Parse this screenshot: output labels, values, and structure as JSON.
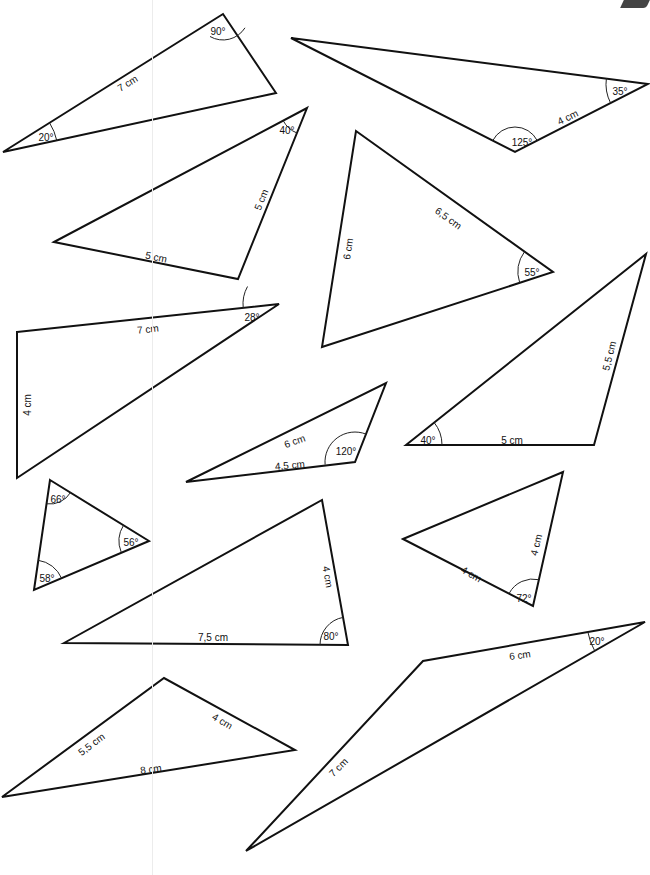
{
  "worksheet": {
    "triangles": [
      {
        "id": 1,
        "vertices": [
          [
            3,
            152
          ],
          [
            223,
            14
          ],
          [
            276,
            93
          ]
        ],
        "labels": [
          {
            "type": "angle",
            "text": "90°",
            "x": 218,
            "y": 32,
            "rot": 0
          },
          {
            "type": "angle",
            "text": "20°",
            "x": 46,
            "y": 138,
            "rot": 0
          },
          {
            "type": "side",
            "text": "7 cm",
            "x": 128,
            "y": 84,
            "rot": -32
          }
        ]
      },
      {
        "id": 2,
        "vertices": [
          [
            291,
            38
          ],
          [
            648,
            84
          ],
          [
            515,
            152
          ]
        ],
        "labels": [
          {
            "type": "angle",
            "text": "35°",
            "x": 620,
            "y": 92,
            "rot": 0
          },
          {
            "type": "angle",
            "text": "125°",
            "x": 522,
            "y": 143,
            "rot": 0
          },
          {
            "type": "side",
            "text": "4 cm",
            "x": 568,
            "y": 118,
            "rot": -26
          }
        ]
      },
      {
        "id": 3,
        "vertices": [
          [
            54,
            242
          ],
          [
            307,
            108
          ],
          [
            238,
            279
          ]
        ],
        "labels": [
          {
            "type": "angle",
            "text": "40°",
            "x": 287,
            "y": 131,
            "rot": 0
          },
          {
            "type": "side",
            "text": "5 cm",
            "x": 262,
            "y": 200,
            "rot": -68
          },
          {
            "type": "side",
            "text": "5 cm",
            "x": 156,
            "y": 258,
            "rot": 12
          }
        ]
      },
      {
        "id": 4,
        "vertices": [
          [
            356,
            131
          ],
          [
            553,
            272
          ],
          [
            322,
            347
          ]
        ],
        "labels": [
          {
            "type": "side",
            "text": "6,5 cm",
            "x": 448,
            "y": 219,
            "rot": 36
          },
          {
            "type": "side",
            "text": "6 cm",
            "x": 349,
            "y": 249,
            "rot": -82
          },
          {
            "type": "angle",
            "text": "55°",
            "x": 532,
            "y": 273,
            "rot": 0
          }
        ]
      },
      {
        "id": 5,
        "vertices": [
          [
            17,
            332
          ],
          [
            279,
            304
          ],
          [
            17,
            478
          ]
        ],
        "labels": [
          {
            "type": "side",
            "text": "7 cm",
            "x": 148,
            "y": 330,
            "rot": -6
          },
          {
            "type": "side",
            "text": "4 cm",
            "x": 28,
            "y": 405,
            "rot": -90
          },
          {
            "type": "angle",
            "text": "28°",
            "x": 252,
            "y": 318,
            "rot": 0
          }
        ]
      },
      {
        "id": 6,
        "vertices": [
          [
            406,
            445
          ],
          [
            646,
            254
          ],
          [
            594,
            445
          ]
        ],
        "labels": [
          {
            "type": "angle",
            "text": "40°",
            "x": 428,
            "y": 441,
            "rot": 0
          },
          {
            "type": "side",
            "text": "5 cm",
            "x": 512,
            "y": 441,
            "rot": 0
          },
          {
            "type": "side",
            "text": "5,5 cm",
            "x": 610,
            "y": 356,
            "rot": -76
          }
        ]
      },
      {
        "id": 7,
        "vertices": [
          [
            186,
            482
          ],
          [
            386,
            383
          ],
          [
            355,
            462
          ]
        ],
        "labels": [
          {
            "type": "side",
            "text": "6 cm",
            "x": 295,
            "y": 442,
            "rot": -20
          },
          {
            "type": "side",
            "text": "4,5 cm",
            "x": 290,
            "y": 466,
            "rot": -5
          },
          {
            "type": "angle",
            "text": "120°",
            "x": 346,
            "y": 452,
            "rot": 0
          }
        ]
      },
      {
        "id": 8,
        "vertices": [
          [
            50,
            480
          ],
          [
            149,
            541
          ],
          [
            34,
            590
          ]
        ],
        "labels": [
          {
            "type": "angle",
            "text": "66°",
            "x": 58,
            "y": 500,
            "rot": 0
          },
          {
            "type": "angle",
            "text": "56°",
            "x": 131,
            "y": 543,
            "rot": 0
          },
          {
            "type": "angle",
            "text": "58°",
            "x": 47,
            "y": 579,
            "rot": 0
          }
        ]
      },
      {
        "id": 9,
        "vertices": [
          [
            64,
            643
          ],
          [
            322,
            500
          ],
          [
            348,
            645
          ]
        ],
        "labels": [
          {
            "type": "side",
            "text": "7,5 cm",
            "x": 213,
            "y": 638,
            "rot": 0
          },
          {
            "type": "side",
            "text": "4 cm",
            "x": 327,
            "y": 577,
            "rot": 80
          },
          {
            "type": "angle",
            "text": "80°",
            "x": 331,
            "y": 637,
            "rot": 0
          }
        ]
      },
      {
        "id": 10,
        "vertices": [
          [
            403,
            539
          ],
          [
            563,
            472
          ],
          [
            533,
            606
          ]
        ],
        "labels": [
          {
            "type": "side",
            "text": "4 cm",
            "x": 471,
            "y": 575,
            "rot": 30
          },
          {
            "type": "side",
            "text": "4 cm",
            "x": 537,
            "y": 545,
            "rot": -76
          },
          {
            "type": "angle",
            "text": "72°",
            "x": 524,
            "y": 599,
            "rot": 0
          }
        ]
      },
      {
        "id": 11,
        "vertices": [
          [
            2,
            797
          ],
          [
            164,
            678
          ],
          [
            295,
            750
          ]
        ],
        "labels": [
          {
            "type": "side",
            "text": "5,5 cm",
            "x": 92,
            "y": 745,
            "rot": -37
          },
          {
            "type": "side",
            "text": "4 cm",
            "x": 222,
            "y": 722,
            "rot": 30
          },
          {
            "type": "side",
            "text": "8 cm",
            "x": 151,
            "y": 770,
            "rot": -8
          }
        ]
      },
      {
        "id": 12,
        "vertices": [
          [
            246,
            851
          ],
          [
            423,
            661
          ],
          [
            645,
            622
          ]
        ],
        "labels": [
          {
            "type": "side",
            "text": "7 cm",
            "x": 339,
            "y": 768,
            "rot": -45
          },
          {
            "type": "side",
            "text": "6 cm",
            "x": 520,
            "y": 656,
            "rot": -8
          },
          {
            "type": "angle",
            "text": "20°",
            "x": 597,
            "y": 642,
            "rot": 0
          }
        ]
      }
    ],
    "arcs": [
      {
        "tri": 1,
        "cx": 223,
        "cy": 14,
        "r": 26,
        "a1": 32,
        "a2": 120
      },
      {
        "tri": 1,
        "cx": 3,
        "cy": 152,
        "r": 55,
        "a1": -32,
        "a2": -12
      },
      {
        "tri": 2,
        "cx": 648,
        "cy": 84,
        "r": 42,
        "a1": 153,
        "a2": 188
      },
      {
        "tri": 2,
        "cx": 515,
        "cy": 152,
        "r": 25,
        "a1": 207,
        "a2": 333
      },
      {
        "tri": 3,
        "cx": 307,
        "cy": 108,
        "r": 27,
        "a1": 112,
        "a2": 152
      },
      {
        "tri": 4,
        "cx": 553,
        "cy": 272,
        "r": 35,
        "a1": 162,
        "a2": 216
      },
      {
        "tri": 5,
        "cx": 279,
        "cy": 304,
        "r": 36,
        "a1": 174,
        "a2": 209
      },
      {
        "tri": 6,
        "cx": 406,
        "cy": 445,
        "r": 36,
        "a1": -39,
        "a2": 0
      },
      {
        "tri": 7,
        "cx": 355,
        "cy": 462,
        "r": 30,
        "a1": 175,
        "a2": 292
      },
      {
        "tri": 8,
        "cx": 50,
        "cy": 480,
        "r": 24,
        "a1": 31,
        "a2": 98
      },
      {
        "tri": 8,
        "cx": 149,
        "cy": 541,
        "r": 30,
        "a1": 158,
        "a2": 212
      },
      {
        "tri": 8,
        "cx": 34,
        "cy": 590,
        "r": 30,
        "a1": -82,
        "a2": -23
      },
      {
        "tri": 9,
        "cx": 348,
        "cy": 645,
        "r": 28,
        "a1": 180,
        "a2": 260
      },
      {
        "tri": 10,
        "cx": 533,
        "cy": 606,
        "r": 27,
        "a1": 208,
        "a2": 283
      },
      {
        "tri": 12,
        "cx": 645,
        "cy": 622,
        "r": 58,
        "a1": 150,
        "a2": 170
      }
    ]
  }
}
